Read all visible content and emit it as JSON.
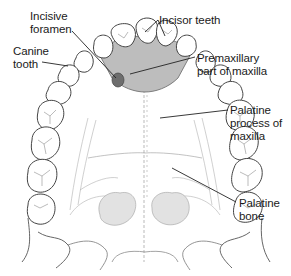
{
  "diagram": {
    "labels": [
      {
        "id": "incisive-foramen",
        "text": "Incisive\nforamen",
        "x": 30,
        "y": 10
      },
      {
        "id": "incisor-teeth",
        "text": "Incisor teeth",
        "x": 158,
        "y": 13
      },
      {
        "id": "canine-tooth",
        "text": "Canine\ntooth",
        "x": 13,
        "y": 45
      },
      {
        "id": "premaxillary-part",
        "text": "Premaxillary\npart of maxilla",
        "x": 197,
        "y": 52
      },
      {
        "id": "palatine-process",
        "text": "Palatine\nprocess of\nmaxilla",
        "x": 230,
        "y": 107
      },
      {
        "id": "palatine-bone",
        "text": "Palatine\nbone",
        "x": 238,
        "y": 197
      }
    ],
    "colors": {
      "line": "#333333",
      "premaxilla_fill": "#b8b8b8",
      "foramen_fill": "#6e6e6e",
      "nasal_fill": "#dcdcdc",
      "sketch": "#a8a8a8"
    }
  }
}
